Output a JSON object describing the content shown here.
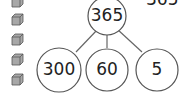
{
  "diagram": {
    "top": {
      "value": "365"
    },
    "children": [
      {
        "value": "300"
      },
      {
        "value": "60"
      },
      {
        "value": "5"
      }
    ],
    "cut_label": "365",
    "cubes": {
      "count": 5,
      "icon": "cube-icon",
      "color": "#9a9a9a"
    },
    "stroke_color": "#555555"
  }
}
